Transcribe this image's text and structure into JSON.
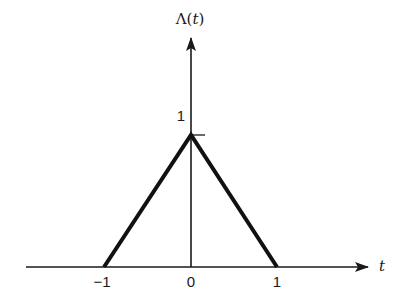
{
  "diagram": {
    "function_label": "Λ(t)",
    "function_symbol": "Λ",
    "function_arg_open": "(",
    "function_arg": "t",
    "function_arg_close": ")",
    "x_axis_label": "t",
    "peak_label": "1",
    "x_ticks": [
      {
        "value": -1,
        "label": "−1"
      },
      {
        "value": 0,
        "label": "0"
      },
      {
        "value": 1,
        "label": "1"
      }
    ],
    "shape_points": [
      [
        -1,
        0
      ],
      [
        0,
        1
      ],
      [
        1,
        0
      ]
    ],
    "colors": {
      "line": "#111111",
      "axis": "#1a1a1a",
      "background": "#ffffff"
    }
  }
}
